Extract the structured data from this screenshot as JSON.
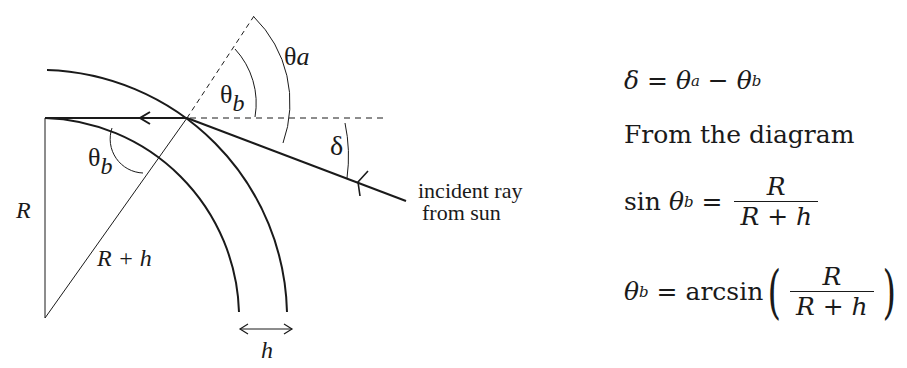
{
  "diagram": {
    "labels": {
      "theta_a": "θ",
      "theta_a_sub": "a",
      "theta_b_upper": "θ",
      "theta_b_upper_sub": "b",
      "theta_b_lower": "θ",
      "theta_b_lower_sub": "b",
      "delta": "δ",
      "R": "R",
      "R_plus_h": "R + h",
      "h": "h",
      "incident_line1": "incident ray",
      "incident_line2": "from sun"
    }
  },
  "equations": {
    "eq1": {
      "lhs": "δ",
      "eq": " = ",
      "t1": "θ",
      "t1_sub": "a",
      "minus": " − ",
      "t2": "θ",
      "t2_sub": "b"
    },
    "text": "From the diagram",
    "eq2": {
      "fn": "sin ",
      "var": "θ",
      "var_sub": "b",
      "eq": " = ",
      "num": "R",
      "den": "R + h"
    },
    "eq3": {
      "var": "θ",
      "var_sub": "b",
      "eq": " = ",
      "fn": "arcsin",
      "lp": "(",
      "num": "R",
      "den": "R + h",
      "rp": ")"
    }
  },
  "colors": {
    "ink": "#1a1a1a",
    "background": "#ffffff"
  }
}
